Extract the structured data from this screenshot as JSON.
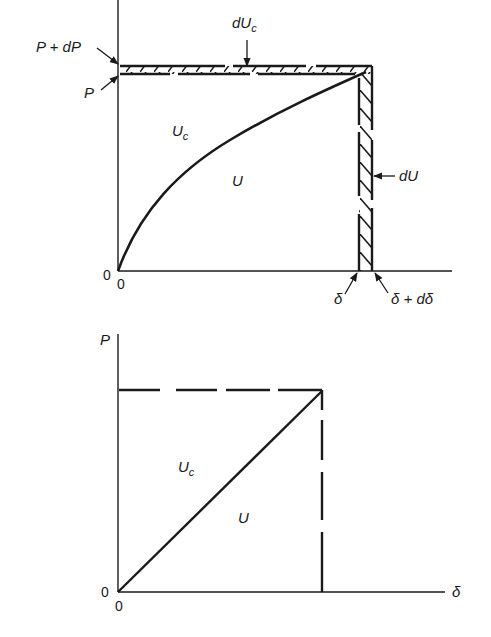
{
  "figure": {
    "upper_diagram": {
      "description": "Nonlinear load-deflection curve with strain energy U and complementary energy Uc, plus increments",
      "labels": {
        "P_plus_dP": "P + dP",
        "P": "P",
        "dUc_main": "dU",
        "dUc_sub": "c",
        "Uc_main": "U",
        "Uc_sub": "c",
        "U": "U",
        "dU": "dU",
        "origin_y": "0",
        "origin_x": "0",
        "delta": "δ",
        "delta_plus_ddelta": "δ + dδ"
      }
    },
    "lower_diagram": {
      "description": "Linear load-deflection line with strain energy U and complementary energy Uc",
      "labels": {
        "P_axis": "P",
        "Uc_main": "U",
        "Uc_sub": "c",
        "U": "U",
        "origin_y": "0",
        "origin_x": "0",
        "delta_axis": "δ"
      }
    }
  },
  "colors": {
    "ink": "#1a1a1a",
    "background": "#ffffff"
  }
}
